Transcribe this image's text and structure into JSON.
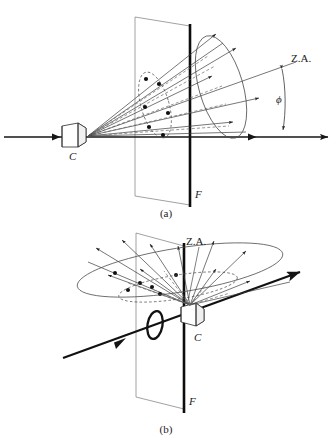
{
  "figure": {
    "background_color": "#ffffff",
    "ink_color": "#1a1a1a",
    "panels": [
      {
        "id": "a",
        "caption": "(a)",
        "description": "Side view: camera C on horizontal optical axis projecting a cone of rays that pierces the focal plane F; the cone axis is the Z.A. inclined by angle phi from the horizontal axis.",
        "labels": {
          "camera": "C",
          "plane": "F",
          "zenith_axis": "Z.A.",
          "angle": "ϕ"
        }
      },
      {
        "id": "b",
        "caption": "(b)",
        "description": "Oblique view: camera C at the plane F with the ray cone opening up and to the left, the Z.A. marked with a leader, and the optical axis passing through a lens ring.",
        "labels": {
          "camera": "C",
          "plane": "F",
          "zenith_axis": "Z.A."
        }
      }
    ],
    "legend_terms": [
      {
        "symbol": "C",
        "meaning": "camera perspective center"
      },
      {
        "symbol": "F",
        "meaning": "focal / film plane"
      },
      {
        "symbol": "Z.A.",
        "meaning": "zenith axis"
      },
      {
        "symbol": "ϕ",
        "meaning": "angle between zenith axis and optical axis"
      }
    ]
  }
}
